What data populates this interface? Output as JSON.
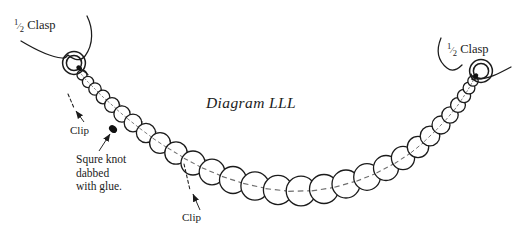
{
  "diagram": {
    "title": "Diagram LLL",
    "background_color": "#ffffff",
    "ink_color": "#1b1b1b"
  },
  "labels": {
    "clasp_left": {
      "numerator": "1",
      "denominator": "2",
      "text": "Clasp"
    },
    "clasp_right": {
      "numerator": "1",
      "denominator": "2",
      "text": "Clasp"
    },
    "clip_left": "Clip",
    "clip_bottom": "Clip",
    "knot": "Squre knot\ndabbed\nwith glue."
  },
  "chart_data": {
    "type": "scatter",
    "title": "Diagram LLL",
    "xlabel": "",
    "ylabel": "",
    "xlim": [
      0,
      518
    ],
    "ylim": [
      0,
      235
    ],
    "grid": false,
    "legend": null,
    "note": "Catenary strand of round beads; bead radius grows from clasp ends toward the bottom center. Coordinates are in screenshot pixels, y measured downward.",
    "series": [
      {
        "name": "beads",
        "points": [
          {
            "x": 82,
            "y": 75,
            "r": 5.0
          },
          {
            "x": 88,
            "y": 82,
            "r": 5.6
          },
          {
            "x": 95,
            "y": 89,
            "r": 6.2
          },
          {
            "x": 103,
            "y": 97,
            "r": 6.8
          },
          {
            "x": 112,
            "y": 105,
            "r": 7.4
          },
          {
            "x": 122,
            "y": 114,
            "r": 8.1
          },
          {
            "x": 133,
            "y": 123,
            "r": 8.8
          },
          {
            "x": 146,
            "y": 133,
            "r": 9.6
          },
          {
            "x": 160,
            "y": 143,
            "r": 10.4
          },
          {
            "x": 176,
            "y": 153,
            "r": 11.2
          },
          {
            "x": 193,
            "y": 163,
            "r": 12.0
          },
          {
            "x": 212,
            "y": 172,
            "r": 12.8
          },
          {
            "x": 233,
            "y": 180,
            "r": 13.5
          },
          {
            "x": 255,
            "y": 186,
            "r": 14.1
          },
          {
            "x": 278,
            "y": 190,
            "r": 14.6
          },
          {
            "x": 301,
            "y": 191,
            "r": 14.8
          },
          {
            "x": 324,
            "y": 189,
            "r": 14.5
          },
          {
            "x": 346,
            "y": 184,
            "r": 14.0
          },
          {
            "x": 367,
            "y": 177,
            "r": 13.3
          },
          {
            "x": 386,
            "y": 168,
            "r": 12.5
          },
          {
            "x": 403,
            "y": 158,
            "r": 11.6
          },
          {
            "x": 418,
            "y": 147,
            "r": 10.7
          },
          {
            "x": 430,
            "y": 136,
            "r": 9.8
          },
          {
            "x": 441,
            "y": 125,
            "r": 9.0
          },
          {
            "x": 450,
            "y": 115,
            "r": 8.2
          },
          {
            "x": 458,
            "y": 105,
            "r": 7.4
          },
          {
            "x": 464,
            "y": 96,
            "r": 6.6
          },
          {
            "x": 469,
            "y": 88,
            "r": 5.9
          },
          {
            "x": 473,
            "y": 81,
            "r": 5.2
          }
        ]
      },
      {
        "name": "clasp-rings",
        "points": [
          {
            "x": 74,
            "y": 63,
            "r_outer": 11.5,
            "r_inner": 7.5
          },
          {
            "x": 481,
            "y": 71,
            "r_outer": 11.5,
            "r_inner": 7.5
          }
        ]
      },
      {
        "name": "knots",
        "points": [
          {
            "x": 113,
            "y": 129
          }
        ]
      },
      {
        "name": "clip-marks",
        "points": [
          {
            "x": 72,
            "y": 101,
            "angle_deg": 70
          },
          {
            "x": 186,
            "y": 171,
            "angle_deg": 95
          }
        ]
      }
    ]
  }
}
